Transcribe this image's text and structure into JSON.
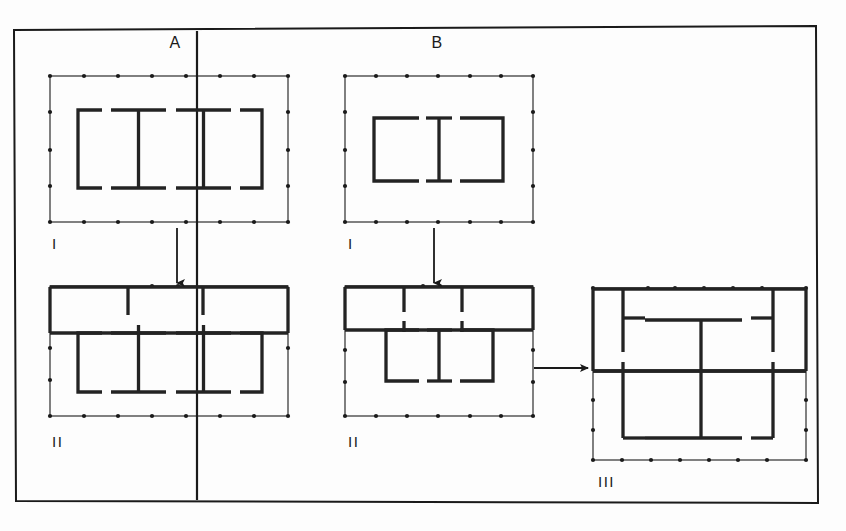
{
  "figure": {
    "title_a": "A",
    "title_b": "B",
    "frame": {
      "x": 14,
      "y": 26,
      "width": 804,
      "height": 477,
      "stroke": "#1a1a1a",
      "stroke_width": 2.0
    },
    "divider": {
      "x": 197,
      "y1": 30,
      "y2": 500,
      "stroke": "#1a1a1a",
      "stroke_width": 2.0
    },
    "colors": {
      "ink": "#1a1a1a",
      "wall": "#232323",
      "paper": "#fdfdfd"
    }
  },
  "column_labels": [
    {
      "id": "col-a",
      "text": "A",
      "x": 175,
      "y": 48
    },
    {
      "id": "col-b",
      "text": "B",
      "x": 437,
      "y": 48
    }
  ],
  "panels": [
    {
      "id": "a-1",
      "column": "A",
      "phase": "I",
      "phase_label": "I",
      "label_x": 52,
      "label_y": 249,
      "outer": {
        "x": 50,
        "y": 76,
        "width": 238,
        "height": 146
      },
      "dots_top": 8,
      "dots_bottom": 8,
      "dots_left": 4,
      "dots_right": 4,
      "pattern": "[ I I ]",
      "description": "outer palisade rectangle with dotted post holes; inner plan of left bracket, two I-shaped units and right bracket"
    },
    {
      "id": "a-2",
      "column": "A",
      "phase": "II",
      "phase_label": "II",
      "label_x": 52,
      "label_y": 447,
      "outer": {
        "x": 50,
        "y": 286,
        "width": 238,
        "height": 130
      },
      "dots_top": 3,
      "dots_bottom": 8,
      "dots_left": 3,
      "dots_right": 2,
      "pattern": "[ I I ] with solid north range",
      "description": "same plan as phase I with solid thick north wall range added and internal cross walls"
    },
    {
      "id": "b-1",
      "column": "B",
      "phase": "I",
      "phase_label": "I",
      "label_x": 348,
      "label_y": 249,
      "outer": {
        "x": 345,
        "y": 76,
        "width": 188,
        "height": 146
      },
      "dots_top": 6,
      "dots_bottom": 6,
      "dots_left": 4,
      "dots_right": 4,
      "pattern": "[ I ]",
      "description": "outer palisade rectangle with dotted post holes; inner plan of left bracket, one I-shaped unit and right bracket"
    },
    {
      "id": "b-2",
      "column": "B",
      "phase": "II",
      "phase_label": "II",
      "label_x": 348,
      "label_y": 447,
      "outer": {
        "x": 345,
        "y": 286,
        "width": 188,
        "height": 130
      },
      "dots_top": 2,
      "dots_bottom": 6,
      "dots_left": 3,
      "dots_right": 3,
      "pattern": "[ I ] with solid north range",
      "description": "same plan as phase I with solid thick north wall range added and short internal partitions"
    },
    {
      "id": "b-3",
      "column": "B",
      "phase": "III",
      "phase_label": "III",
      "label_x": 598,
      "label_y": 487,
      "outer": {
        "x": 593,
        "y": 288,
        "width": 213,
        "height": 172
      },
      "dots_top": 6,
      "dots_bottom": 6,
      "dots_left": 3,
      "dots_right": 3,
      "pattern": "grid of rooms",
      "description": "square enclosure with orthogonal grid of internal rooms around a central courtyard"
    }
  ],
  "arrows": [
    {
      "id": "arrow-a-1-to-2",
      "type": "down",
      "x": 177,
      "y1": 228,
      "y2": 283,
      "from": "a-1",
      "to": "a-2"
    },
    {
      "id": "arrow-b-1-to-2",
      "type": "down",
      "x": 434,
      "y1": 228,
      "y2": 283,
      "from": "b-1",
      "to": "b-2"
    },
    {
      "id": "arrow-b-2-to-3",
      "type": "right",
      "y": 368,
      "x1": 534,
      "x2": 588,
      "from": "b-2",
      "to": "b-3"
    }
  ]
}
